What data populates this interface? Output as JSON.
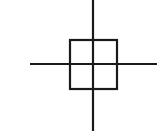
{
  "icon": {
    "name": "crosshair-position-icon",
    "stroke_color": "#1a1a1a",
    "background": "#ffffff"
  }
}
